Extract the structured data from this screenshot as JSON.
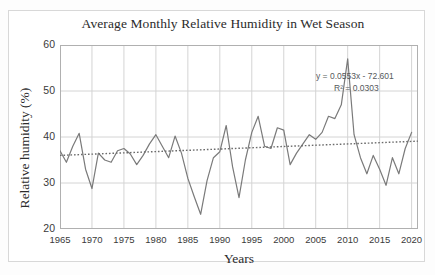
{
  "chart_data": {
    "type": "line",
    "title": "Average Monthly Relative Humidity in Wet Season",
    "xlabel": "Years",
    "ylabel": "Relative humidity (%)",
    "xlim": [
      1965,
      2021
    ],
    "ylim": [
      20,
      60
    ],
    "ytick_labels": [
      "20",
      "30",
      "40",
      "50",
      "60"
    ],
    "ytick_values": [
      20,
      30,
      40,
      50,
      60
    ],
    "xtick_labels": [
      "1965",
      "1970",
      "1975",
      "1980",
      "1985",
      "1990",
      "1995",
      "2000",
      "2005",
      "2010",
      "2015",
      "2020"
    ],
    "xtick_values": [
      1965,
      1970,
      1975,
      1980,
      1985,
      1990,
      1995,
      2000,
      2005,
      2010,
      2015,
      2020
    ],
    "grid": true,
    "legend": "none",
    "series": [
      {
        "name": "Average monthly relative humidity",
        "style": "solid",
        "color": "#7a7a7a",
        "x": [
          1965,
          1966,
          1967,
          1968,
          1969,
          1970,
          1971,
          1972,
          1973,
          1974,
          1975,
          1976,
          1977,
          1978,
          1979,
          1980,
          1981,
          1982,
          1983,
          1984,
          1985,
          1986,
          1987,
          1988,
          1989,
          1990,
          1991,
          1992,
          1993,
          1994,
          1995,
          1996,
          1997,
          1998,
          1999,
          2000,
          2001,
          2002,
          2003,
          2004,
          2005,
          2006,
          2007,
          2008,
          2009,
          2010,
          2011,
          2012,
          2013,
          2014,
          2015,
          2016,
          2017,
          2018,
          2019,
          2020
        ],
        "y": [
          37.0,
          34.5,
          38.0,
          40.8,
          33.0,
          28.8,
          36.5,
          35.0,
          34.5,
          37.0,
          37.5,
          36.3,
          34.0,
          36.0,
          38.5,
          40.5,
          38.0,
          35.5,
          40.2,
          36.5,
          31.0,
          27.0,
          23.2,
          30.5,
          35.5,
          36.8,
          42.5,
          33.5,
          26.8,
          35.0,
          41.0,
          44.5,
          38.0,
          37.5,
          42.0,
          41.5,
          34.0,
          36.5,
          38.5,
          40.5,
          39.5,
          41.0,
          44.5,
          44.0,
          47.0,
          57.0,
          40.5,
          35.5,
          32.0,
          36.0,
          33.0,
          29.5,
          35.5,
          32.0,
          37.5,
          41.0
        ]
      },
      {
        "name": "Linear trendline",
        "style": "dotted",
        "color": "#6b6b6b",
        "x": [
          1965,
          2021
        ],
        "y": [
          36.0,
          39.1
        ]
      }
    ],
    "annotations": {
      "equation": "y = 0.0553x - 72.601",
      "r_squared": "R² = 0.0303"
    },
    "colors": {
      "series_line": "#7a7a7a",
      "trendline": "#6b6b6b",
      "grid": "#d4d4d4",
      "axis": "#b0b0b0",
      "text": "#2b2b2b",
      "annotation_text": "#55595c",
      "background": "#ffffff",
      "page_background": "#fdfdfd"
    }
  }
}
